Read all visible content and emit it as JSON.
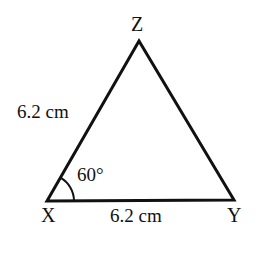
{
  "figure": {
    "kind": "triangle-diagram",
    "background_color": "#ffffff",
    "stroke_color": "#111111",
    "stroke_width": 3,
    "text_color": "#111111"
  },
  "vertices": {
    "z": {
      "label": "Z",
      "x": 139,
      "y": 41
    },
    "x": {
      "label": "X",
      "x": 47,
      "y": 201
    },
    "y": {
      "label": "Y",
      "x": 234,
      "y": 200
    }
  },
  "sides": {
    "xz_label": "6.2 cm",
    "xy_label": "6.2 cm"
  },
  "angles": {
    "at_x_label": "60°",
    "arc_radius": 27
  },
  "chart_data": {
    "type": "diagram",
    "title": "",
    "shape": "triangle",
    "points": [
      {
        "name": "X",
        "x": 47,
        "y": 201
      },
      {
        "name": "Y",
        "x": 234,
        "y": 200
      },
      {
        "name": "Z",
        "x": 139,
        "y": 41
      }
    ],
    "edges": [
      {
        "from": "X",
        "to": "Y",
        "label": "6.2 cm"
      },
      {
        "from": "X",
        "to": "Z",
        "label": "6.2 cm"
      },
      {
        "from": "Z",
        "to": "Y",
        "label": ""
      }
    ],
    "angle_marks": [
      {
        "at": "X",
        "label": "60°",
        "value": 60,
        "unit": "degrees"
      }
    ]
  }
}
